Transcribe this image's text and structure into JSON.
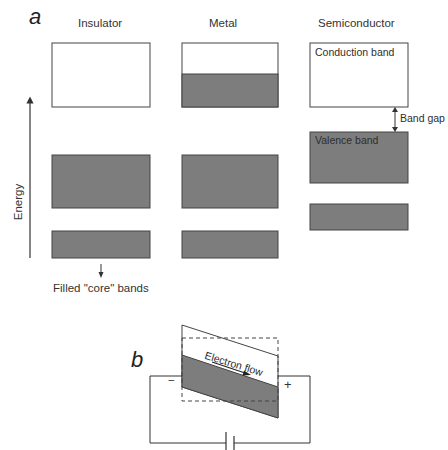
{
  "panel_a": {
    "letter": "a",
    "columns": [
      {
        "title": "Insulator",
        "bands": [
          "empty",
          "filled",
          "filled-core"
        ]
      },
      {
        "title": "Metal",
        "bands": [
          "partially-filled",
          "filled",
          "filled-core"
        ]
      },
      {
        "title": "Semiconductor",
        "bands": [
          "conduction",
          "valence",
          "filled-core"
        ]
      }
    ],
    "axis_label": "Energy",
    "conduction_band_label": "Conduction band",
    "valence_band_label": "Valence band",
    "band_gap_label": "Band gap",
    "core_bands_label": "Filled \"core\" bands"
  },
  "panel_b": {
    "letter": "b",
    "electron_flow_label": "Electron flow",
    "minus_label": "−",
    "plus_label": "+"
  },
  "colors": {
    "filled_band": "#7d7d7d",
    "outline": "#3a3a3a",
    "background": "#ffffff"
  }
}
